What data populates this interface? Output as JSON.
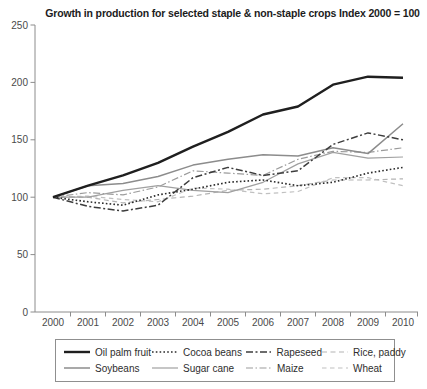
{
  "title": "Growth in production for selected staple & non-staple crops Index 2000 = 100",
  "axis": {
    "x_tick_labels": [
      "2000",
      "2001",
      "2002",
      "2003",
      "2004",
      "2005",
      "2006",
      "2007",
      "2008",
      "2009",
      "2010"
    ],
    "y_tick_labels": [
      "0",
      "50",
      "100",
      "150",
      "200",
      "250"
    ],
    "axis_color": "#8c8c8c",
    "tick_label_color": "#4a4a4a"
  },
  "chart_data": {
    "type": "line",
    "title": "Growth in production for selected staple & non-staple crops Index 2000 = 100",
    "x": [
      2000,
      2001,
      2002,
      2003,
      2004,
      2005,
      2006,
      2007,
      2008,
      2009,
      2010
    ],
    "xlabel": "",
    "ylabel": "",
    "ylim": [
      0,
      250
    ],
    "yticks": [
      0,
      50,
      100,
      150,
      200,
      250
    ],
    "grid": false,
    "legend_position": "bottom",
    "series": [
      {
        "id": "oil-palm-fruit",
        "name": "Oil palm fruit",
        "color": "#1f1f1f",
        "width": 2.4,
        "dash": "",
        "values": [
          100,
          110,
          119,
          130,
          144,
          157,
          172,
          179,
          198,
          205,
          204
        ]
      },
      {
        "id": "cocoa-beans",
        "name": "Cocoa beans",
        "color": "#2b2b2b",
        "width": 1.6,
        "dash": "1.6 2.2",
        "values": [
          100,
          96,
          93,
          102,
          107,
          113,
          115,
          110,
          113,
          121,
          126
        ]
      },
      {
        "id": "rapeseed",
        "name": "Rapeseed",
        "color": "#3d3d3d",
        "width": 1.5,
        "dash": "7 2.5 2 2.5",
        "values": [
          100,
          92,
          88,
          93,
          117,
          126,
          119,
          123,
          146,
          156,
          150
        ]
      },
      {
        "id": "rice-paddy",
        "name": "Rice, paddy",
        "color": "#b4b4b4",
        "width": 1.2,
        "dash": "5 3.5",
        "values": [
          100,
          100,
          95,
          98,
          101,
          106,
          107,
          110,
          115,
          115,
          116
        ]
      },
      {
        "id": "soybeans",
        "name": "Soybeans",
        "color": "#8c8c8c",
        "width": 1.5,
        "dash": "",
        "values": [
          100,
          110,
          112,
          118,
          128,
          133,
          137,
          136,
          143,
          138,
          164
        ]
      },
      {
        "id": "sugar-cane",
        "name": "Sugar cane",
        "color": "#a0a0a0",
        "width": 1.2,
        "dash": "",
        "values": [
          100,
          100,
          106,
          110,
          106,
          104,
          113,
          129,
          139,
          134,
          135
        ]
      },
      {
        "id": "maize",
        "name": "Maize",
        "color": "#9b9b9b",
        "width": 1.2,
        "dash": "7 2.5 1.5 2.5",
        "values": [
          100,
          104,
          102,
          109,
          123,
          121,
          119,
          133,
          140,
          139,
          143
        ]
      },
      {
        "id": "wheat",
        "name": "Wheat",
        "color": "#c0c0c0",
        "width": 1.2,
        "dash": "4.5 3.5",
        "values": [
          100,
          101,
          98,
          96,
          108,
          107,
          103,
          105,
          117,
          117,
          110
        ]
      }
    ]
  }
}
